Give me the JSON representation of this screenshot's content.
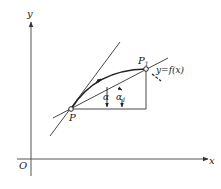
{
  "diagram": {
    "type": "geometry-derivative",
    "axes": {
      "x_label": "x",
      "y_label": "y",
      "origin_label": "O"
    },
    "points": {
      "P": {
        "label": "P"
      },
      "P1": {
        "label": "P",
        "subscript": "1"
      }
    },
    "curve_label": "y=f(x)",
    "angles": {
      "alpha": {
        "label": "α"
      },
      "alpha1": {
        "label": "α",
        "subscript": "1"
      }
    },
    "colors": {
      "stroke": "#333333",
      "axis": "#555555",
      "background": "#ffffff"
    }
  }
}
